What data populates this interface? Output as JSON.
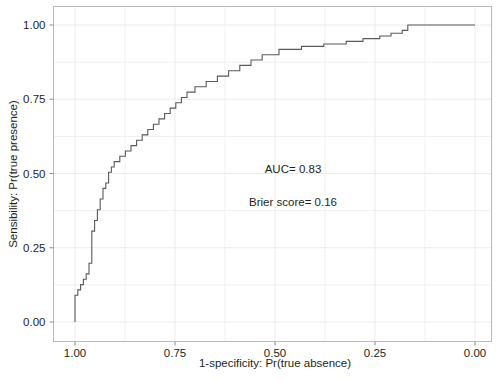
{
  "chart_data": {
    "type": "line",
    "title": "",
    "subtitle": "",
    "xlabel": "1-specificity: Pr(true absence)",
    "ylabel": "Sensibility: Pr(true presence)",
    "xlim": [
      1.0,
      0.0
    ],
    "ylim": [
      0.0,
      1.0
    ],
    "x_reversed": true,
    "grid": true,
    "grid_minor": true,
    "legend": null,
    "legend_position": "none",
    "xticks": [
      1.0,
      0.75,
      0.5,
      0.25,
      0.0
    ],
    "xticklabels": [
      "1.00",
      "0.75",
      "0.50",
      "0.25",
      "0.00"
    ],
    "yticks": [
      0.0,
      0.25,
      0.5,
      0.75,
      1.0
    ],
    "yticklabels": [
      "0.00",
      "0.25",
      "0.50",
      "0.75",
      "1.00"
    ],
    "series": [
      {
        "name": "ROC curve",
        "drawstyle": "steps-post",
        "color": "#595959",
        "linewidth": 1.1,
        "x": [
          1.0,
          1.0,
          0.993,
          0.993,
          0.986,
          0.986,
          0.979,
          0.979,
          0.972,
          0.972,
          0.965,
          0.965,
          0.958,
          0.958,
          0.958,
          0.951,
          0.951,
          0.944,
          0.944,
          0.937,
          0.937,
          0.93,
          0.93,
          0.923,
          0.923,
          0.916,
          0.916,
          0.909,
          0.909,
          0.902,
          0.902,
          0.888,
          0.888,
          0.874,
          0.874,
          0.86,
          0.86,
          0.846,
          0.846,
          0.832,
          0.832,
          0.818,
          0.818,
          0.804,
          0.804,
          0.79,
          0.79,
          0.776,
          0.776,
          0.762,
          0.762,
          0.748,
          0.748,
          0.734,
          0.734,
          0.72,
          0.72,
          0.7,
          0.7,
          0.672,
          0.672,
          0.644,
          0.644,
          0.616,
          0.616,
          0.588,
          0.588,
          0.56,
          0.56,
          0.532,
          0.532,
          0.49,
          0.49,
          0.434,
          0.434,
          0.378,
          0.378,
          0.322,
          0.322,
          0.28,
          0.28,
          0.238,
          0.238,
          0.21,
          0.21,
          0.182,
          0.182,
          0.168,
          0.168,
          0.0
        ],
        "y": [
          0.0,
          0.09,
          0.09,
          0.108,
          0.108,
          0.126,
          0.126,
          0.144,
          0.144,
          0.162,
          0.162,
          0.198,
          0.198,
          0.234,
          0.306,
          0.306,
          0.342,
          0.342,
          0.378,
          0.378,
          0.414,
          0.414,
          0.45,
          0.45,
          0.468,
          0.468,
          0.504,
          0.504,
          0.522,
          0.522,
          0.54,
          0.54,
          0.558,
          0.558,
          0.576,
          0.576,
          0.594,
          0.594,
          0.612,
          0.612,
          0.63,
          0.63,
          0.648,
          0.648,
          0.666,
          0.666,
          0.684,
          0.684,
          0.702,
          0.702,
          0.72,
          0.72,
          0.738,
          0.738,
          0.756,
          0.756,
          0.774,
          0.774,
          0.792,
          0.792,
          0.81,
          0.81,
          0.828,
          0.828,
          0.846,
          0.846,
          0.864,
          0.864,
          0.882,
          0.882,
          0.9,
          0.9,
          0.918,
          0.918,
          0.928,
          0.928,
          0.936,
          0.936,
          0.945,
          0.945,
          0.954,
          0.954,
          0.963,
          0.963,
          0.972,
          0.972,
          0.982,
          0.982,
          1.0,
          1.0
        ]
      }
    ],
    "annotations": [
      {
        "text": "AUC= 0.83",
        "x": 0.455,
        "y": 0.515
      },
      {
        "text": "Brier score= 0.16",
        "x": 0.455,
        "y": 0.405
      }
    ]
  },
  "plot": {
    "auc_label": "AUC= 0.83",
    "brier_label": "Brier score= 0.16",
    "xlabel": "1-specificity: Pr(true absence)",
    "ylabel": "Sensibility: Pr(true presence)",
    "xticklabels": [
      "1.00",
      "0.75",
      "0.50",
      "0.25",
      "0.00"
    ],
    "yticklabels": [
      "0.00",
      "0.25",
      "0.50",
      "0.75",
      "1.00"
    ],
    "colors": {
      "curve": "#595959",
      "frame": "#b9b9b9",
      "grid": "#f0f0f0",
      "text": "#231f20",
      "background": "#ffffff"
    }
  }
}
